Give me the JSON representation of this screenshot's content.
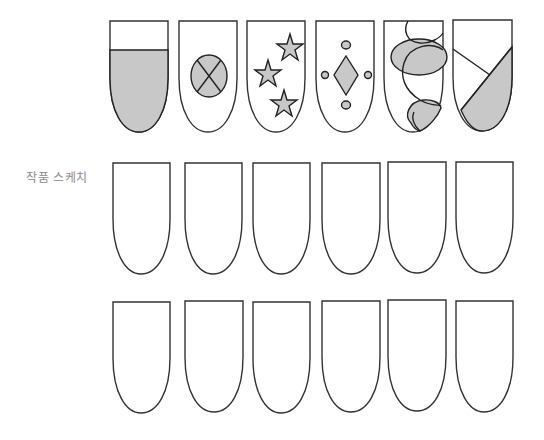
{
  "label": "작품 스케치",
  "colors": {
    "outline": "#333333",
    "fill": "#c8c8c8",
    "background": "#ffffff"
  },
  "rows": [
    {
      "name": "design-examples",
      "nails": [
        {
          "x": 110,
          "design": "french-half-fill"
        },
        {
          "x": 179,
          "design": "oval-with-cross"
        },
        {
          "x": 247,
          "design": "three-stars"
        },
        {
          "x": 316,
          "design": "diamond-with-dots"
        },
        {
          "x": 384,
          "design": "overlapping-loops"
        },
        {
          "x": 453,
          "design": "diagonal-split"
        }
      ],
      "top": 20,
      "bottom": 132
    },
    {
      "name": "blank-sketch-row-1",
      "nails": [
        {
          "x": 113
        },
        {
          "x": 185
        },
        {
          "x": 253
        },
        {
          "x": 322
        },
        {
          "x": 388
        },
        {
          "x": 456
        }
      ],
      "top": 163,
      "bottom": 274
    },
    {
      "name": "blank-sketch-row-2",
      "nails": [
        {
          "x": 113
        },
        {
          "x": 185
        },
        {
          "x": 253
        },
        {
          "x": 322
        },
        {
          "x": 388
        },
        {
          "x": 456
        }
      ],
      "top": 301,
      "bottom": 413
    }
  ]
}
